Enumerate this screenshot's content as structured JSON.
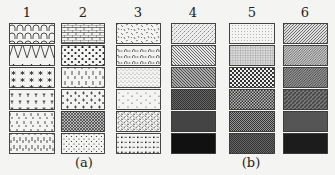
{
  "figure": {
    "columns": [
      {
        "label": "1",
        "group": "a",
        "swatches": [
          "arches",
          "zigzag",
          "asterisks",
          "plant-marks",
          "ticks-sparse",
          "ticks-dense"
        ]
      },
      {
        "label": "2",
        "group": "a",
        "swatches": [
          "brick",
          "large-dots",
          "vertical-dashes",
          "plus-signs",
          "crosshatch-dense",
          "small-dots"
        ]
      },
      {
        "label": "3",
        "group": "a",
        "swatches": [
          "random-dashes",
          "dash-arch",
          "stipple-cluster",
          "sparse-specks",
          "random-dashes-dense",
          "dash-square"
        ]
      },
      {
        "label": "4",
        "group": "b",
        "swatches": [
          "diagonal-light",
          "diagonal-medium",
          "diagonal-gray",
          "checker-dark",
          "dark-gray",
          "black"
        ]
      },
      {
        "label": "5",
        "group": "b",
        "swatches": [
          "fine-dots",
          "fine-grid",
          "checker-coarse",
          "checker-medium",
          "checker-fine",
          "checker-dark"
        ]
      },
      {
        "label": "6",
        "group": "b",
        "swatches": [
          "diagonal-fine",
          "diagonal-fine-2",
          "diagonal-dense",
          "diagonal-dark",
          "dark-gray",
          "near-black"
        ]
      }
    ],
    "captions": {
      "a": "(a)",
      "b": "(b)"
    }
  }
}
